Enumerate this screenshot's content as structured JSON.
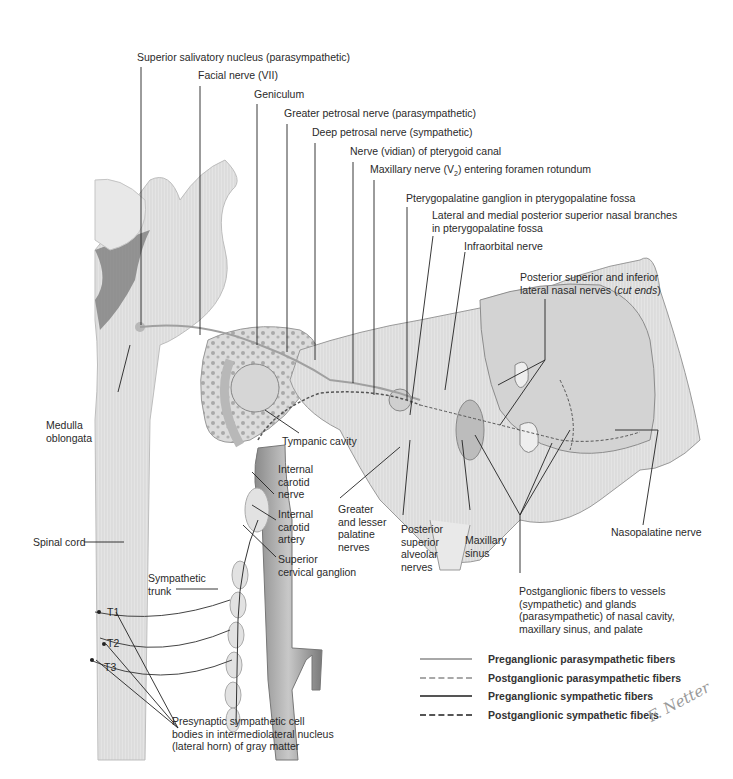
{
  "figure": {
    "style": "grayscale anatomical illustration",
    "signature": "F. Netter"
  },
  "labels": {
    "superior_salivatory_nucleus": "Superior salivatory nucleus (parasympathetic)",
    "facial_nerve": "Facial nerve (VII)",
    "geniculum": "Geniculum",
    "greater_petrosal": "Greater petrosal nerve (parasympathetic)",
    "deep_petrosal": "Deep petrosal nerve (sympathetic)",
    "vidian_nerve": "Nerve (vidian) of pterygoid canal",
    "maxillary_nerve_pre": "Maxillary nerve (V",
    "maxillary_nerve_sub": "2",
    "maxillary_nerve_post": ") entering foramen rotundum",
    "pterygopalatine_ganglion": "Pterygopalatine ganglion in pterygopalatine fossa",
    "nasal_branches_1": "Lateral and medial posterior superior nasal branches",
    "nasal_branches_2": "in pterygopalatine fossa",
    "infraorbital": "Infraorbital nerve",
    "lateral_nasal_1": "Posterior superior and inferior",
    "lateral_nasal_2a": "lateral nasal nerves (",
    "lateral_nasal_2b": "cut ends",
    "lateral_nasal_2c": ")",
    "medulla_1": "Medulla",
    "medulla_2": "oblongata",
    "tympanic_cavity": "Tympanic cavity",
    "int_carotid_nerve": [
      "Internal",
      "carotid",
      "nerve"
    ],
    "int_carotid_artery": [
      "Internal",
      "carotid",
      "artery"
    ],
    "sup_cervical_ganglion": [
      "Superior",
      "cervical ganglion"
    ],
    "palatine_nerves": [
      "Greater",
      "and lesser",
      "palatine",
      "nerves"
    ],
    "psa_nerves": [
      "Posterior",
      "superior",
      "alveolar",
      "nerves"
    ],
    "maxillary_sinus": [
      "Maxillary",
      "sinus"
    ],
    "nasopalatine": "Nasopalatine nerve",
    "spinal_cord": "Spinal cord",
    "sympathetic_trunk": [
      "Sympathetic",
      "trunk"
    ],
    "t1": "T1",
    "t2": "T2",
    "t3": "T3",
    "postganglionic_fibers": [
      "Postganglionic fibers to vessels",
      "(sympathetic) and glands",
      "(parasympathetic) of nasal cavity,",
      "maxillary sinus, and palate"
    ],
    "presynaptic": [
      "Presynaptic sympathetic cell",
      "bodies in intermediolateral nucleus",
      "(lateral horn) of gray matter"
    ]
  },
  "legend": [
    {
      "label": "Preganglionic parasympathetic fibers",
      "style": "solid",
      "color": "#a8a8a8"
    },
    {
      "label": "Postganglionic parasympathetic fibers",
      "style": "dashed",
      "color": "#a8a8a8"
    },
    {
      "label": "Preganglionic sympathetic fibers",
      "style": "solid",
      "color": "#555555"
    },
    {
      "label": "Postganglionic sympathetic fibers",
      "style": "dashed",
      "color": "#555555"
    }
  ]
}
